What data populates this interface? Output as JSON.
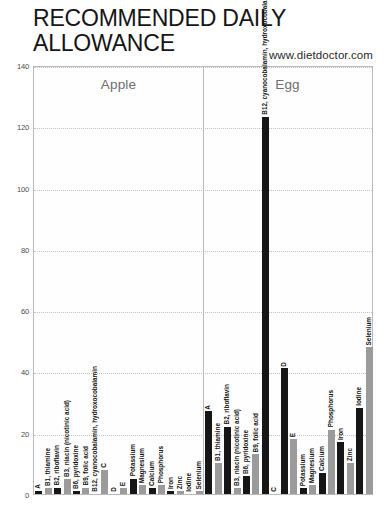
{
  "title": "RECOMMENDED DAILY ALLOWANCE",
  "source": "www.dietdoctor.com",
  "chart_data": {
    "type": "bar",
    "title": "RECOMMENDED DAILY ALLOWANCE",
    "subtitle": "www.dietdoctor.com",
    "xlabel": "",
    "ylabel": "",
    "ylim": [
      0,
      140
    ],
    "yticks": [
      0,
      20,
      40,
      60,
      80,
      100,
      120,
      140
    ],
    "grid": true,
    "legend": "none",
    "panels": [
      "Apple",
      "Egg"
    ],
    "categories": [
      "A",
      "B1, thiamine",
      "B2, riboflavin",
      "B3, niacin (nicotinic acid)",
      "B6, pyridoxine",
      "B9, folic acid",
      "B12, cyanocobalamin, hydroxocobalamin",
      "C",
      "D",
      "E",
      "Potassium",
      "Magnesium",
      "Calcium",
      "Phosphorus",
      "Iron",
      "Zinc",
      "Iodine",
      "Selenium"
    ],
    "series": [
      {
        "name": "Apple",
        "values": [
          1,
          2,
          2,
          5,
          1,
          2,
          0,
          8,
          0,
          2,
          5,
          3,
          2,
          3,
          1,
          1,
          0,
          1
        ]
      },
      {
        "name": "Egg",
        "values": [
          27,
          10,
          22,
          2,
          6,
          13,
          123,
          0,
          41,
          18,
          2,
          3,
          7,
          21,
          17,
          10,
          28,
          48
        ]
      }
    ],
    "bar_colors": {
      "dark": "#161616",
      "light": "#9b9b9b"
    }
  }
}
